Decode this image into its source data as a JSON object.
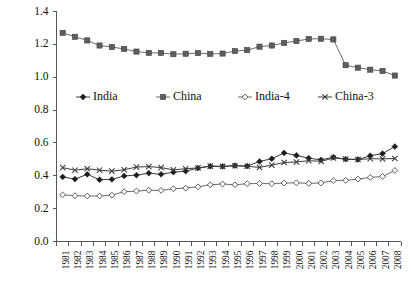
{
  "chart_data": {
    "type": "line",
    "title": "",
    "subtitle": "",
    "xlabel": "",
    "ylabel": "",
    "ylim": [
      0.0,
      1.4
    ],
    "ytick_labels": [
      "0.0",
      "0.2",
      "0.4",
      "0.6",
      "0.8",
      "1.0",
      "1.2",
      "1.4"
    ],
    "ytick_values": [
      0.0,
      0.2,
      0.4,
      0.6,
      0.8,
      1.0,
      1.2,
      1.4
    ],
    "grid": false,
    "legend_position": "upper-center-inside",
    "categories": [
      "1981",
      "1982",
      "1983",
      "1984",
      "1985",
      "1986",
      "1987",
      "1988",
      "1989",
      "1990",
      "1991",
      "1992",
      "1993",
      "1994",
      "1995",
      "1996",
      "1997",
      "1998",
      "1999",
      "2000",
      "2001",
      "2002",
      "2003",
      "2004",
      "2005",
      "2006",
      "2007",
      "2008"
    ],
    "series": [
      {
        "name": "India",
        "marker": "filled-diamond",
        "values": [
          0.393,
          0.38,
          0.409,
          0.376,
          0.378,
          0.399,
          0.404,
          0.416,
          0.409,
          0.422,
          0.428,
          0.447,
          0.458,
          0.457,
          0.462,
          0.459,
          0.487,
          0.504,
          0.539,
          0.524,
          0.507,
          0.497,
          0.513,
          0.501,
          0.499,
          0.522,
          0.535,
          0.578
        ]
      },
      {
        "name": "China",
        "marker": "filled-square",
        "values": [
          1.27,
          1.246,
          1.224,
          1.193,
          1.184,
          1.172,
          1.156,
          1.148,
          1.148,
          1.14,
          1.143,
          1.147,
          1.142,
          1.144,
          1.159,
          1.165,
          1.186,
          1.193,
          1.209,
          1.22,
          1.233,
          1.234,
          1.23,
          1.073,
          1.058,
          1.046,
          1.038,
          1.01
        ]
      },
      {
        "name": "India-4",
        "marker": "open-diamond",
        "values": [
          0.284,
          0.279,
          0.277,
          0.277,
          0.282,
          0.303,
          0.307,
          0.312,
          0.311,
          0.321,
          0.325,
          0.333,
          0.345,
          0.35,
          0.345,
          0.352,
          0.353,
          0.352,
          0.356,
          0.357,
          0.354,
          0.356,
          0.371,
          0.372,
          0.38,
          0.39,
          0.396,
          0.432
        ]
      },
      {
        "name": "China-3",
        "marker": "cross",
        "values": [
          0.45,
          0.434,
          0.443,
          0.434,
          0.428,
          0.437,
          0.453,
          0.456,
          0.45,
          0.436,
          0.443,
          0.448,
          0.459,
          0.457,
          0.461,
          0.458,
          0.451,
          0.465,
          0.481,
          0.484,
          0.492,
          0.488,
          0.508,
          0.502,
          0.499,
          0.504,
          0.503,
          0.505
        ]
      }
    ]
  },
  "legend": {
    "items": [
      {
        "label": "India",
        "marker": "filled-diamond"
      },
      {
        "label": "China",
        "marker": "filled-square"
      },
      {
        "label": "India-4",
        "marker": "open-diamond"
      },
      {
        "label": "China-3",
        "marker": "cross"
      }
    ]
  },
  "colors": {
    "china_marker": "#5e5e5e",
    "india_marker": "#1c1c1c",
    "line": "#6b6b6b",
    "axis": "#555555",
    "background": "#ffffff"
  }
}
